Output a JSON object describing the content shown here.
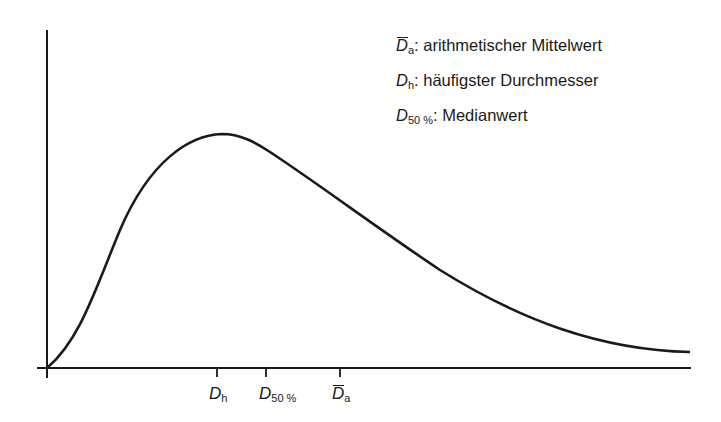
{
  "diagram": {
    "type": "distribution-curve",
    "legend": [
      {
        "symbol": "D",
        "subscript": "a",
        "overbar": true,
        "separator": ":",
        "description": "arithmetischer Mittelwert"
      },
      {
        "symbol": "D",
        "subscript": "h",
        "overbar": false,
        "separator": ":",
        "description": "häufigster Durchmesser"
      },
      {
        "symbol": "D",
        "subscript": "50 %",
        "overbar": false,
        "separator": ":",
        "description": "Medianwert"
      }
    ],
    "x_markers": [
      {
        "symbol": "D",
        "subscript": "h",
        "overbar": false,
        "meaning": "mode"
      },
      {
        "symbol": "D",
        "subscript": "50 %",
        "overbar": false,
        "meaning": "median"
      },
      {
        "symbol": "D",
        "subscript": "a",
        "overbar": true,
        "meaning": "mean"
      }
    ],
    "curve_shape": "right-skewed unimodal",
    "colors": {
      "line": "#1a1a1a",
      "background": "#ffffff"
    }
  }
}
